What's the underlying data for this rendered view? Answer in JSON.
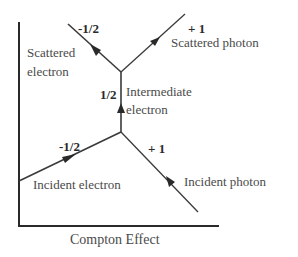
{
  "caption": "Compton Effect",
  "particles": {
    "scattered_electron": {
      "label_line1": "Scattered",
      "label_line2": "electron",
      "spin": "-1/2"
    },
    "scattered_photon": {
      "label": "Scattered photon",
      "spin": "+ 1"
    },
    "intermediate_electron": {
      "label_line1": "Intermediate",
      "label_line2": "electron",
      "spin": "1/2"
    },
    "incident_electron": {
      "label": "Incident electron",
      "spin": "-1/2"
    },
    "incident_photon": {
      "label": "Incident photon",
      "spin": "+ 1"
    }
  },
  "colors": {
    "line": "#3a3a3a",
    "axis": "#2a2a2a",
    "text": "#4a4a4a"
  }
}
